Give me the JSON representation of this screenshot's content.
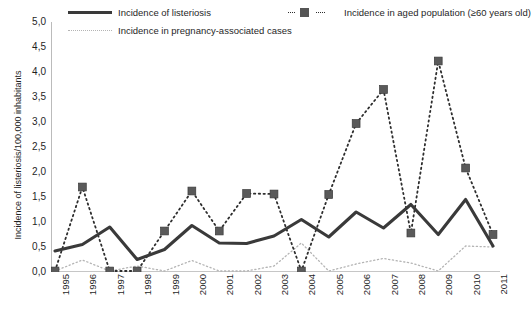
{
  "chart_data": {
    "type": "line",
    "title": "",
    "xlabel": "",
    "ylabel": "Incidence of listeriosis/100,000 inhabitants",
    "ylim": [
      0.0,
      5.0
    ],
    "ytick_step": 0.5,
    "ytick_labels": [
      "5,0",
      "4,5",
      "4,0",
      "3,5",
      "3,0",
      "2,5",
      "2,0",
      "1,5",
      "1,0",
      "0,5",
      "0,0"
    ],
    "grid": false,
    "legend_position": "top",
    "decimal_separator": ",",
    "categories": [
      "1995",
      "1996",
      "1997",
      "1998",
      "1999",
      "2000",
      "2001",
      "2002",
      "2003",
      "2004",
      "2005",
      "2006",
      "2007",
      "2008",
      "2009",
      "2010",
      "2011"
    ],
    "series": [
      {
        "name": "Incidence of listeriosis",
        "style": "solid",
        "color": "#3a3a3a",
        "marker": "none",
        "values": [
          0.42,
          0.55,
          0.9,
          0.25,
          0.45,
          0.93,
          0.58,
          0.57,
          0.72,
          1.05,
          0.7,
          1.2,
          0.88,
          1.35,
          0.75,
          1.45,
          0.52
        ]
      },
      {
        "name": "Incidence in aged population (≥60 years old)",
        "style": "dashed",
        "color": "#2e2e2e",
        "marker": "square",
        "values": [
          0.02,
          1.7,
          0.02,
          0.02,
          0.82,
          1.62,
          0.82,
          1.57,
          1.56,
          0.02,
          1.55,
          2.97,
          3.65,
          0.78,
          4.22,
          2.08,
          0.75
        ]
      },
      {
        "name": "Incidence in pregnancy-associated cases",
        "style": "dotted",
        "color": "#b4b4b4",
        "marker": "none",
        "values": [
          0.02,
          0.24,
          0.02,
          0.12,
          0.02,
          0.23,
          0.02,
          0.02,
          0.12,
          0.58,
          0.02,
          0.16,
          0.27,
          0.18,
          0.02,
          0.52,
          0.5
        ]
      }
    ]
  },
  "legend": {
    "items": [
      {
        "label": "Incidence of listeriosis",
        "icon": "solid-line-swatch"
      },
      {
        "label": "Incidence in pregnancy-associated cases",
        "icon": "dotted-line-swatch"
      },
      {
        "label": "Incidence in aged population (≥60 years old)",
        "icon": "dashed-square-marker-swatch"
      }
    ]
  }
}
